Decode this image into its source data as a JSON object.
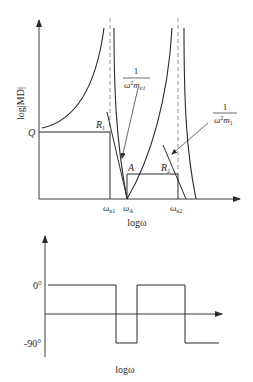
{
  "top_chart": {
    "y_axis_label": "log|MD|",
    "x_axis_label": "logω",
    "level_labels": {
      "Q": "Q",
      "R1": "R",
      "R1_sub": "1",
      "A": "A",
      "R2": "R",
      "R2_sub": "2"
    },
    "x_ticks": {
      "wn1": "ω",
      "wn1_sub": "n1",
      "wA": "ω",
      "wA_sub": "A",
      "wn2": "ω",
      "wn2_sub": "n2"
    },
    "annotations": {
      "me1": {
        "numerator": "1",
        "denominator_base": "ω",
        "denominator_exp": "2",
        "denominator_var": "m",
        "denominator_sub": "e1"
      },
      "m1": {
        "numerator": "1",
        "denominator_base": "ω",
        "denominator_exp": "2",
        "denominator_var": "m",
        "denominator_sub": "1"
      }
    }
  },
  "bottom_chart": {
    "x_axis_label": "logω",
    "y_ticks": {
      "zero": "0°",
      "minus90": "-90°"
    }
  },
  "colors": {
    "line": "#2a2a2a",
    "axis": "#3a3a3a",
    "dashed": "#777777"
  }
}
